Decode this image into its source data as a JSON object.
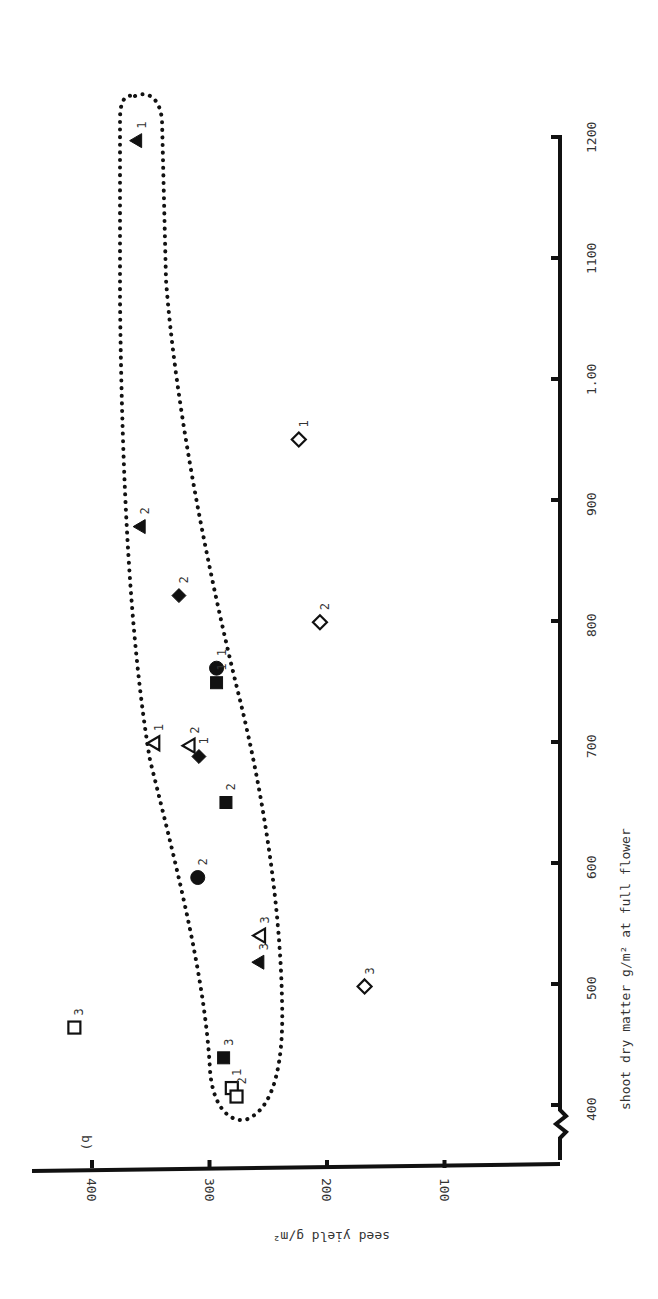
{
  "chart_data": {
    "type": "scatter",
    "panel_label": "b)",
    "orientation": "rotated 90° clockwise",
    "xlabel": "shoot dry matter g/m² at full flower",
    "ylabel": "seed yield g/m²",
    "xlim": [
      370,
      1200
    ],
    "ylim": [
      0,
      430
    ],
    "x_ticks": [
      400,
      500,
      600,
      700,
      800,
      900,
      1000,
      1100,
      1200
    ],
    "x_tick_labels": [
      "400",
      "500",
      "600",
      "700",
      "800",
      "900",
      "1.00",
      "1100",
      "1200"
    ],
    "y_ticks": [
      100,
      200,
      300,
      400
    ],
    "y_tick_labels": [
      "100",
      "200",
      "300",
      "400"
    ],
    "grid": false,
    "legend": null,
    "annotation": "dotted envelope enclosing filled-symbol points and open triangles",
    "series": [
      {
        "name": "filled triangle",
        "marker": "triangle-filled",
        "points": [
          {
            "x": 1197,
            "y": 362,
            "label": "1"
          },
          {
            "x": 878,
            "y": 359,
            "label": "2"
          },
          {
            "x": 518,
            "y": 258,
            "label": "3"
          }
        ]
      },
      {
        "name": "open triangle",
        "marker": "triangle-open",
        "points": [
          {
            "x": 699,
            "y": 347,
            "label": "1"
          },
          {
            "x": 697,
            "y": 317,
            "label": "2"
          },
          {
            "x": 540,
            "y": 257,
            "label": "3"
          }
        ]
      },
      {
        "name": "filled diamond",
        "marker": "diamond-filled",
        "points": [
          {
            "x": 688,
            "y": 309,
            "label": "1"
          },
          {
            "x": 821,
            "y": 326,
            "label": "2"
          }
        ]
      },
      {
        "name": "open diamond",
        "marker": "diamond-open",
        "points": [
          {
            "x": 950,
            "y": 224,
            "label": "1"
          },
          {
            "x": 799,
            "y": 206,
            "label": "2"
          },
          {
            "x": 498,
            "y": 168,
            "label": "3"
          }
        ]
      },
      {
        "name": "filled circle",
        "marker": "circle-filled",
        "points": [
          {
            "x": 761,
            "y": 294,
            "label": "1"
          },
          {
            "x": 588,
            "y": 310,
            "label": "2"
          }
        ]
      },
      {
        "name": "filled square",
        "marker": "square-filled",
        "points": [
          {
            "x": 749,
            "y": 294,
            "label": "1"
          },
          {
            "x": 650,
            "y": 286,
            "label": "2"
          },
          {
            "x": 439,
            "y": 288,
            "label": "3"
          }
        ]
      },
      {
        "name": "open square",
        "marker": "square-open",
        "points": [
          {
            "x": 414,
            "y": 281,
            "label": "1"
          },
          {
            "x": 407,
            "y": 277,
            "label": "2"
          },
          {
            "x": 464,
            "y": 415,
            "label": "3"
          }
        ]
      }
    ]
  }
}
